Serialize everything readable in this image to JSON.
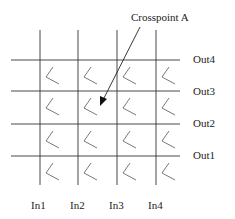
{
  "diagram": {
    "annotation": "Crosspoint A",
    "inputs": [
      "In1",
      "In2",
      "In3",
      "In4"
    ],
    "outputs": [
      "Out4",
      "Out3",
      "Out2",
      "Out1"
    ],
    "grid": {
      "rows": 4,
      "cols": 4
    },
    "line_color": "#333333",
    "arrow_target": {
      "row": "Out3",
      "col": "In2"
    }
  }
}
